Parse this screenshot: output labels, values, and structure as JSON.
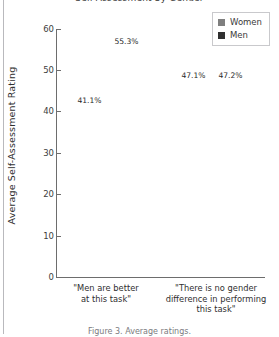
{
  "figure": {
    "title_fragment": "Self-Assessment by Gender",
    "caption_fragment": "Figure 3. Average ratings."
  },
  "legend": {
    "position": "top-right",
    "entries": [
      {
        "label": "Women",
        "color": "#7f7f7f",
        "swatch": "legend-swatch-women"
      },
      {
        "label": "Men",
        "color": "#303030",
        "swatch": "legend-swatch-men"
      }
    ]
  },
  "axis": {
    "ylabel": "Average Self-Assessment Rating",
    "yticks": [
      "0",
      "10",
      "20",
      "30",
      "40",
      "50",
      "60"
    ]
  },
  "chart_data": {
    "type": "bar",
    "title": "Self-Assessment by Gender",
    "xlabel": "",
    "ylabel": "Average Self-Assessment Rating",
    "ylim": [
      0,
      60
    ],
    "yticks": [
      0,
      10,
      20,
      30,
      40,
      50,
      60
    ],
    "grid": false,
    "legend_position": "upper right",
    "categories": [
      "\"Men are better at this task\"",
      "\"There is no gender difference in performing this task\""
    ],
    "category_lines": [
      [
        "\"Men are better",
        "at this task\""
      ],
      [
        "\"There is no gender",
        "difference in performing",
        "this task\""
      ]
    ],
    "series": [
      {
        "name": "Women",
        "color": "#7f7f7f",
        "values": [
          41.1,
          47.1
        ],
        "labels": [
          "41.1%",
          "47.1%"
        ]
      },
      {
        "name": "Men",
        "color": "#303030",
        "values": [
          55.3,
          47.2
        ],
        "labels": [
          "55.3%",
          "47.2%"
        ]
      }
    ]
  }
}
